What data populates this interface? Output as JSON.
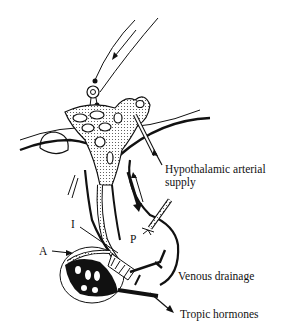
{
  "diagram": {
    "labels": {
      "arterial_line1": "Hypothalamic arterial",
      "arterial_line2": "supply",
      "venous": "Venous drainage",
      "tropic": "Tropic hormones",
      "A": "A",
      "I": "I",
      "P": "P"
    },
    "colors": {
      "ink": "#111111",
      "background": "#ffffff",
      "stipple": "#d8d8d8"
    }
  }
}
